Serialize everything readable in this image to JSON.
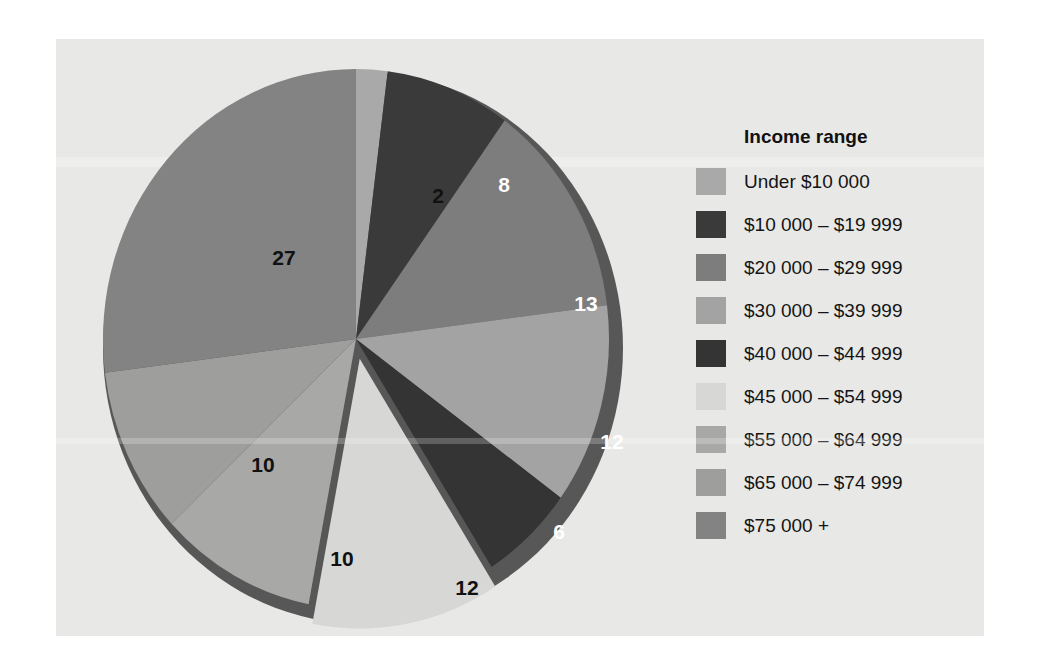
{
  "figure": {
    "background_color": "#e8e8e6",
    "page_color": "#ffffff"
  },
  "legend": {
    "title": "Income range",
    "items": [
      {
        "label": "Under $10 000",
        "color": "#a9a9a9"
      },
      {
        "label": "$10 000 – $19 999",
        "color": "#3a3a3a"
      },
      {
        "label": "$20 000 – $29 999",
        "color": "#7d7d7d"
      },
      {
        "label": "$30 000 – $39 999",
        "color": "#a3a3a3"
      },
      {
        "label": "$40 000 – $44 999",
        "color": "#343434"
      },
      {
        "label": "$45 000 – $54 999",
        "color": "#d7d7d5"
      },
      {
        "label": "$55 000 – $64 999",
        "color": "#a8a8a6"
      },
      {
        "label": "$65 000 – $74 999",
        "color": "#9e9e9c"
      },
      {
        "label": "$75 000 +",
        "color": "#838383"
      }
    ]
  },
  "chart_data": {
    "type": "pie",
    "title": "",
    "legend_title": "Income range",
    "legend_position": "right",
    "units": "percent",
    "total": 100,
    "exploded_slices": [
      "$45 000 – $54 999"
    ],
    "categories": [
      "Under $10 000",
      "$10 000 – $19 999",
      "$20 000 – $29 999",
      "$30 000 – $39 999",
      "$40 000 – $44 999",
      "$45 000 – $54 999",
      "$55 000 – $64 999",
      "$65 000 – $74 999",
      "$75 000 +"
    ],
    "values": [
      2,
      8,
      13,
      12,
      6,
      12,
      10,
      10,
      27
    ],
    "colors": [
      "#a9a9a9",
      "#3a3a3a",
      "#7d7d7d",
      "#a3a3a3",
      "#343434",
      "#d7d7d5",
      "#a8a8a6",
      "#9e9e9c",
      "#838383"
    ],
    "slice_label_colors": [
      "dark",
      "light",
      "light",
      "light",
      "light",
      "dark",
      "dark",
      "dark",
      "dark"
    ]
  },
  "slice_labels": [
    {
      "text": "2",
      "x": 382,
      "y": 156,
      "tone": "dark"
    },
    {
      "text": "8",
      "x": 448,
      "y": 145,
      "tone": "light"
    },
    {
      "text": "13",
      "x": 530,
      "y": 264,
      "tone": "light"
    },
    {
      "text": "12",
      "x": 556,
      "y": 402,
      "tone": "light"
    },
    {
      "text": "6",
      "x": 503,
      "y": 492,
      "tone": "light"
    },
    {
      "text": "12",
      "x": 411,
      "y": 548,
      "tone": "dark"
    },
    {
      "text": "10",
      "x": 286,
      "y": 519,
      "tone": "dark"
    },
    {
      "text": "10",
      "x": 207,
      "y": 425,
      "tone": "dark"
    },
    {
      "text": "27",
      "x": 228,
      "y": 218,
      "tone": "dark"
    }
  ]
}
